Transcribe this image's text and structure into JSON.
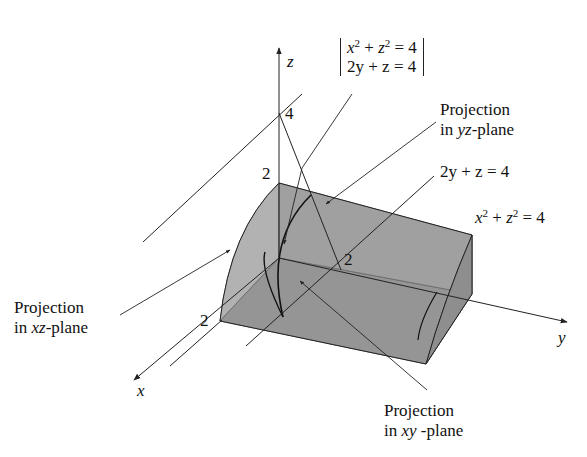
{
  "figure": {
    "axes": {
      "x_label": "x",
      "y_label": "y",
      "z_label": "z"
    },
    "ticks": {
      "z_4": "4",
      "z_2": "2",
      "x_2": "2",
      "y_2": "2"
    },
    "system": {
      "eq1_lhs_a": "x",
      "eq1_lhs_b": "z",
      "eq1_exp": "2",
      "eq1_rhs": "= 4",
      "eq2": "2y + z = 4"
    },
    "labels": {
      "proj_yz_line1": "Projection",
      "proj_yz_line2_pre": "in ",
      "proj_yz_line2_var": "yz",
      "proj_yz_line2_post": "-plane",
      "plane_eq": "2y + z = 4",
      "cyl_eq_a": "x",
      "cyl_eq_b": "z",
      "cyl_eq_exp": "2",
      "cyl_eq_rhs": "= 4",
      "proj_xz_line1": "Projection",
      "proj_xz_line2_pre": "in ",
      "proj_xz_line2_var": "xz",
      "proj_xz_line2_post": "-plane",
      "proj_xy_line1": "Projection",
      "proj_xy_line2_pre": "in ",
      "proj_xy_line2_var": "xy",
      "proj_xy_line2_post": " -plane"
    },
    "colors": {
      "solid_light": "#c8c8c8",
      "solid_mid": "#9a9a9a",
      "solid_dark": "#7f7f7f",
      "line": "#222222"
    }
  }
}
